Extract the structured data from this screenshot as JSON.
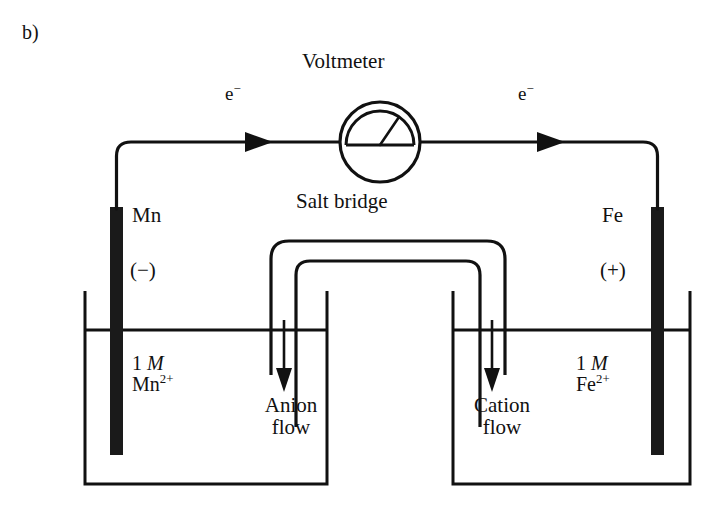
{
  "figure": {
    "panel_label": "b)",
    "type": "galvanic-cell-diagram"
  },
  "meter": {
    "label": "Voltmeter",
    "icon": "analog-voltmeter-dial"
  },
  "salt_bridge": {
    "label": "Salt bridge",
    "icon": "inverted-u-tube"
  },
  "circuit": {
    "electron_label_left": "e",
    "electron_label_left_charge": "−",
    "electron_label_right": "e",
    "electron_label_right_charge": "−",
    "wire_arrow_direction": "right"
  },
  "left_half_cell": {
    "electrode_label": "Mn",
    "polarity": "(−)",
    "concentration": "1",
    "concentration_unit": "M",
    "ion_symbol": "Mn",
    "ion_charge": "2+",
    "ion_flow_label_line1": "Anion",
    "ion_flow_label_line2": "flow",
    "flow_direction": "down"
  },
  "right_half_cell": {
    "electrode_label": "Fe",
    "polarity": "(+)",
    "concentration": "1",
    "concentration_unit": "M",
    "ion_symbol": "Fe",
    "ion_charge": "2+",
    "ion_flow_label_line1": "Cation",
    "ion_flow_label_line2": "flow",
    "flow_direction": "down"
  },
  "colors": {
    "ink": "#111111",
    "background": "#ffffff",
    "electrode_fill": "#1a1a1a"
  }
}
